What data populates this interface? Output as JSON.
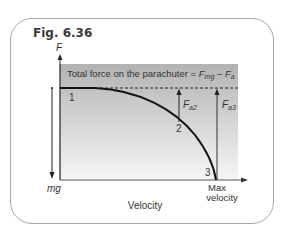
{
  "figure": {
    "title": "Fig. 6.36",
    "y_axis_label": "F",
    "x_axis_label": "Velocity",
    "x_axis_end_label_line1": "Max",
    "x_axis_end_label_line2": "velocity",
    "weight_label": "mg",
    "banner": {
      "text": "Total force on the parachuter = ",
      "term1_base": "F",
      "term1_sub": "mg",
      "minus": " – ",
      "term2_base": "F",
      "term2_sub": "a"
    },
    "points": [
      {
        "label": "1"
      },
      {
        "label": "2"
      },
      {
        "label": "3"
      }
    ],
    "arrows": [
      {
        "base": "F",
        "sub": "a2"
      },
      {
        "base": "F",
        "sub": "a3"
      }
    ],
    "colors": {
      "shade_top": "#b4b4b4",
      "shade_bottom": "#f4f4f4",
      "line": "#1a1a1a",
      "border": "#a8a8a8"
    }
  }
}
